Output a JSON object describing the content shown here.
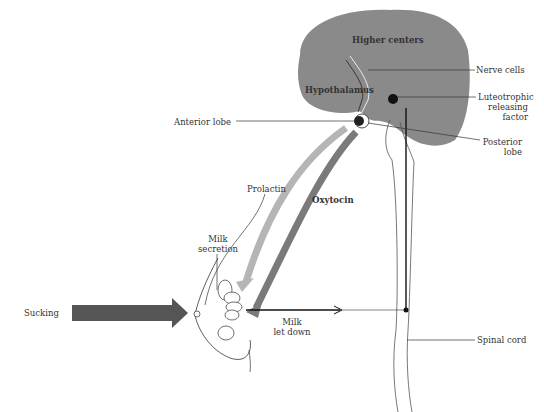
{
  "diagram": {
    "labels": {
      "higher_centers": "Higher centers",
      "nerve_cells": "Nerve cells",
      "hypothalamus": "Hypothalamus",
      "luteotrophic_line1": "Luteotrophic",
      "luteotrophic_line2": "releasing",
      "luteotrophic_line3": "factor",
      "anterior_lobe": "Anterior lobe",
      "posterior_line1": "Posterior",
      "posterior_line2": "lobe",
      "prolactin": "Prolactin",
      "oxytocin": "Oxytocin",
      "milk_secretion_line1": "Milk",
      "milk_secretion_line2": "secretion",
      "sucking": "Sucking",
      "milk_letdown_line1": "Milk",
      "milk_letdown_line2": "let down",
      "spinal_cord": "Spinal cord"
    },
    "colors": {
      "brain": "#8a8a8a",
      "prolactin_arrow": "#b5b5b5",
      "oxytocin_arrow": "#7a7a7a",
      "sucking_arrow": "#555555",
      "line": "#222222"
    }
  }
}
